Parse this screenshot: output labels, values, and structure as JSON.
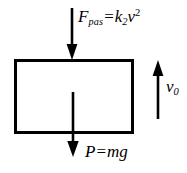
{
  "diagram": {
    "background_color": "#ffffff",
    "stroke_color": "#000000",
    "body": {
      "shape": "rectangle",
      "x": 14,
      "y": 59,
      "width": 119,
      "height": 74,
      "stroke_width": 3
    },
    "arrows": [
      {
        "name": "drag-force-arrow",
        "direction": "down",
        "x": 72,
        "y_start": 8,
        "y_end": 60
      },
      {
        "name": "weight-arrow",
        "direction": "down",
        "x": 73,
        "y_start": 92,
        "y_end": 157
      },
      {
        "name": "velocity-arrow",
        "direction": "up",
        "x": 158,
        "y_start": 119,
        "y_end": 60
      }
    ],
    "labels": {
      "drag_force": {
        "symbol": "F",
        "subscript": "pas",
        "operator": "=",
        "coefficient": "k",
        "coefficient_subscript": "2",
        "variable": "v",
        "exponent": "2",
        "plain": "F_pas = k_2 v^2"
      },
      "weight": {
        "symbol": "P",
        "operator": "=",
        "expression_mass": "m",
        "expression_gravity": "g",
        "plain": "P = mg"
      },
      "velocity": {
        "symbol": "v",
        "subscript": "0",
        "plain": "v_0"
      }
    }
  }
}
